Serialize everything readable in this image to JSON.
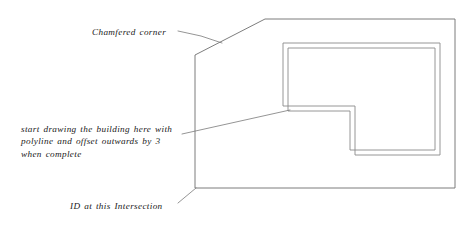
{
  "drawing": {
    "title": "Site plan with chamfered corner and L-shaped building",
    "background_color": "#ffffff",
    "line_color": "#6e6e6e",
    "leader_color": "#7a7a7a",
    "text_color": "#1a1a1a",
    "width": 475,
    "height": 225
  },
  "annotations": {
    "chamfer": {
      "label": "Chamfered  corner",
      "leader": "leader-line-chamfer"
    },
    "start_drawing": {
      "line1": "start  drawing  the  building  here  with",
      "line2": "polyline  and  offset  outwards  by  3",
      "line3": "when  complete",
      "leader": "leader-line-start-drawing"
    },
    "intersection": {
      "label": "ID  at  this  Intersection",
      "leader": "leader-line-intersection"
    }
  },
  "geometry": {
    "site_boundary": {
      "name": "site-boundary-outline",
      "points": "195,55 265,19 455,19 455,188 195,188 195,55",
      "chamfer_start": "195,55",
      "chamfer_end": "265,19"
    },
    "building_outer": {
      "name": "building-outer-offset-outline",
      "points": "283,43 440,43 440,155 355,155 355,106 283,106 283,43"
    },
    "building_inner": {
      "name": "building-inner-polyline-outline",
      "points": "288,48 435,48 435,150 350,150 350,111 288,111 288,48"
    },
    "leaders": {
      "chamfer": "178,31 201,36 222,43",
      "start_drawing": "182,134 290,110",
      "intersection": "178,203 196,188"
    }
  }
}
